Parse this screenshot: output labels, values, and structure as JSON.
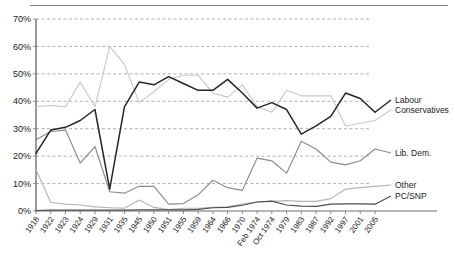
{
  "chart_data": {
    "type": "line",
    "title": "",
    "subtitle": "",
    "xlabel": "",
    "ylabel": "",
    "ylim": [
      0,
      70
    ],
    "yticks": [
      0,
      10,
      20,
      30,
      40,
      50,
      60,
      70
    ],
    "ytick_labels": [
      "0%",
      "10%",
      "20%",
      "30%",
      "40%",
      "50%",
      "60%",
      "70%"
    ],
    "grid": true,
    "grid_style": "dashed-horizontal",
    "legend_position": "right",
    "categories": [
      "1918",
      "1922",
      "1923",
      "1924",
      "1929",
      "1931",
      "1935",
      "1945",
      "1950",
      "1951",
      "1955",
      "1959",
      "1964",
      "1966",
      "1970",
      "Feb 1974",
      "Oct 1974",
      "1979",
      "1983",
      "1987",
      "1992",
      "1997",
      "2001",
      "2005"
    ],
    "series": [
      {
        "name": "Labour",
        "color": "#262626",
        "values": [
          21,
          29.5,
          30.5,
          33,
          37,
          8,
          38,
          47,
          46,
          49,
          46.5,
          44,
          44,
          48,
          43,
          37.5,
          39.5,
          37,
          28,
          31,
          34.5,
          43,
          41,
          36
        ]
      },
      {
        "name": "Conservatives",
        "color": "#c9c9c9",
        "values": [
          38,
          38.5,
          38,
          47,
          38,
          60,
          53.5,
          39.5,
          43.5,
          48,
          49.5,
          49.5,
          43,
          41.5,
          46,
          38,
          36,
          44,
          42,
          42,
          42,
          31,
          32,
          33
        ]
      },
      {
        "name": "Lib. Dem.",
        "color": "#8c8c8c",
        "values": [
          26,
          29,
          29.5,
          17.5,
          23.5,
          7,
          6.5,
          9,
          9,
          2.5,
          2.7,
          5.9,
          11.2,
          8.5,
          7.5,
          19.3,
          18.3,
          13.8,
          25.4,
          22.6,
          17.8,
          16.8,
          18.3,
          22.6
        ]
      },
      {
        "name": "Other",
        "color": "#b5b5b5",
        "values": [
          15,
          3.2,
          2.5,
          2.2,
          1.5,
          1.2,
          1,
          4,
          1.3,
          0.5,
          1,
          1,
          1.3,
          1.5,
          2.5,
          3.3,
          3.5,
          3.8,
          3.5,
          3.5,
          4.5,
          8,
          8.5,
          9
        ]
      },
      {
        "name": "PC/SNP",
        "color": "#4d4d4d",
        "values": [
          0.2,
          0.3,
          0.3,
          0.3,
          0.3,
          0.3,
          0.3,
          0.4,
          0.4,
          0.4,
          0.4,
          0.6,
          1.2,
          1.3,
          2.1,
          3.3,
          3.6,
          2.2,
          1.8,
          1.7,
          2.5,
          2.6,
          2.6,
          2.5
        ]
      }
    ],
    "legend": [
      {
        "label": "Labour",
        "color": "#262626"
      },
      {
        "label": "Conservatives",
        "color": "#c9c9c9"
      },
      {
        "label": "Lib. Dem.",
        "color": "#8c8c8c"
      },
      {
        "label": "Other",
        "color": "#b5b5b5"
      },
      {
        "label": "PC/SNP",
        "color": "#4d4d4d"
      }
    ]
  }
}
